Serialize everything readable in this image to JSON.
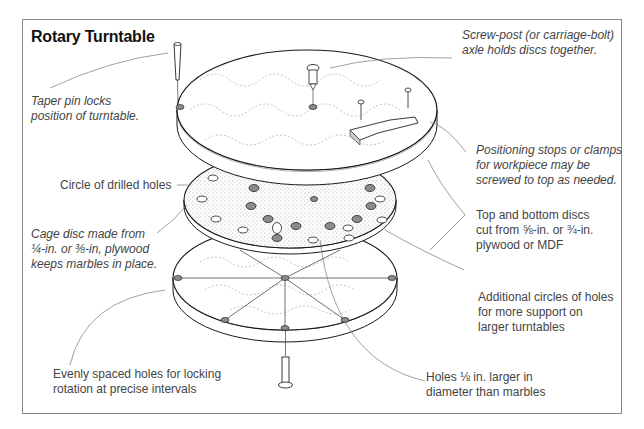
{
  "title": "Rotary Turntable",
  "colors": {
    "frame": "#8a8a8a",
    "text": "#444444",
    "title": "#111111",
    "line": "#1a1a1a",
    "leader": "#777777",
    "stipple": "#9a9a9a",
    "hole_fill": "#8c8c8c"
  },
  "callouts": {
    "taper_pin": {
      "lines": [
        "Taper pin locks",
        "position of turntable."
      ],
      "style": "italic"
    },
    "screw_post": {
      "lines": [
        "Screw-post (or carriage-bolt)",
        "axle holds discs together."
      ],
      "style": "italic"
    },
    "positioning_stops": {
      "lines": [
        "Positioning stops or clamps",
        "for workpiece may be",
        "screwed to top as needed."
      ],
      "style": "italic"
    },
    "circle_holes": {
      "lines": [
        "Circle of drilled holes"
      ],
      "style": "normal"
    },
    "cage_disc": {
      "lines": [
        "Cage disc made from",
        "¼-in. or ⅜-in, plywood",
        "keeps marbles in place."
      ],
      "style": "italic"
    },
    "top_bottom_discs": {
      "lines": [
        "Top and bottom discs",
        "cut from ⅝-in. or ¾-in.",
        "plywood or MDF"
      ],
      "style": "normal"
    },
    "additional_holes": {
      "lines": [
        "Additional circles of holes",
        "for more support on",
        "larger turntables"
      ],
      "style": "normal"
    },
    "evenly_spaced": {
      "lines": [
        "Evenly spaced holes for locking",
        "rotation at precise intervals"
      ],
      "style": "normal"
    },
    "holes_larger": {
      "lines": [
        "Holes ⅛ in. larger in",
        "diameter than marbles"
      ],
      "style": "normal"
    }
  },
  "parts": [
    "top-disc",
    "cage-disc",
    "bottom-disc",
    "taper-pin",
    "screw-post",
    "positioning-stop",
    "wood-screws",
    "marbles",
    "axle-bolt"
  ]
}
